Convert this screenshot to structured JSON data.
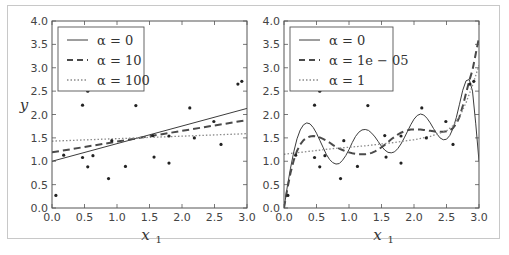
{
  "chart_data": [
    {
      "type": "line",
      "title": "",
      "xlabel": "x_1",
      "ylabel": "y",
      "xlim": [
        0,
        3
      ],
      "ylim": [
        0,
        4
      ],
      "xticks": [
        "0.0",
        "0.5",
        "1.0",
        "1.5",
        "2.0",
        "2.5",
        "3.0"
      ],
      "yticks": [
        "0.0",
        "0.5",
        "1.0",
        "1.5",
        "2.0",
        "2.5",
        "3.0",
        "3.5",
        "4.0"
      ],
      "grid": false,
      "legend_position": "upper left",
      "scatter": {
        "x": [
          0.06,
          0.18,
          0.47,
          0.47,
          0.55,
          0.55,
          0.63,
          0.87,
          0.92,
          1.13,
          1.29,
          1.55,
          1.57,
          1.8,
          1.8,
          2.12,
          2.19,
          2.49,
          2.6,
          2.86,
          2.92
        ],
        "y": [
          0.27,
          1.13,
          2.2,
          1.08,
          2.5,
          0.88,
          1.12,
          0.63,
          1.44,
          0.89,
          2.19,
          1.55,
          1.09,
          0.96,
          1.54,
          2.14,
          1.5,
          1.85,
          1.36,
          2.65,
          2.71
        ]
      },
      "series": [
        {
          "name": "α = 0",
          "style": "solid",
          "x": [
            0,
            3
          ],
          "y": [
            1.0,
            2.13
          ]
        },
        {
          "name": "α = 10",
          "style": "dashed",
          "x": [
            0,
            3
          ],
          "y": [
            1.19,
            1.88
          ]
        },
        {
          "name": "α = 100",
          "style": "dotted",
          "x": [
            0,
            3
          ],
          "y": [
            1.43,
            1.59
          ]
        }
      ]
    },
    {
      "type": "line",
      "title": "",
      "xlabel": "x_1",
      "ylabel": "",
      "xlim": [
        0,
        3
      ],
      "ylim": [
        0,
        4
      ],
      "xticks": [
        "0.0",
        "0.5",
        "1.0",
        "1.5",
        "2.0",
        "2.5",
        "3.0"
      ],
      "yticks": [
        "0.0",
        "0.5",
        "1.0",
        "1.5",
        "2.0",
        "2.5",
        "3.0",
        "3.5",
        "4.0"
      ],
      "grid": false,
      "legend_position": "upper left",
      "scatter": {
        "x": [
          0.06,
          0.18,
          0.47,
          0.47,
          0.55,
          0.55,
          0.63,
          0.87,
          0.92,
          1.13,
          1.29,
          1.55,
          1.57,
          1.8,
          1.8,
          2.12,
          2.19,
          2.49,
          2.6,
          2.86,
          2.92
        ],
        "y": [
          0.27,
          1.13,
          2.2,
          1.08,
          2.5,
          0.88,
          1.12,
          0.63,
          1.44,
          0.89,
          2.19,
          1.55,
          1.09,
          0.96,
          1.54,
          2.14,
          1.5,
          1.85,
          1.36,
          2.65,
          2.71
        ]
      },
      "series": [
        {
          "name": "α = 0",
          "style": "solid",
          "x": [
            0.0,
            0.05,
            0.1,
            0.15,
            0.2,
            0.25,
            0.3,
            0.35,
            0.4,
            0.45,
            0.5,
            0.55,
            0.6,
            0.65,
            0.7,
            0.75,
            0.8,
            0.85,
            0.9,
            0.95,
            1.0,
            1.05,
            1.1,
            1.15,
            1.2,
            1.25,
            1.3,
            1.35,
            1.4,
            1.45,
            1.5,
            1.55,
            1.6,
            1.65,
            1.7,
            1.75,
            1.8,
            1.85,
            1.9,
            1.95,
            2.0,
            2.05,
            2.1,
            2.15,
            2.2,
            2.25,
            2.3,
            2.35,
            2.4,
            2.45,
            2.5,
            2.55,
            2.6,
            2.65,
            2.7,
            2.75,
            2.8,
            2.85,
            2.9,
            2.95,
            3.0
          ],
          "y": [
            0.0,
            0.45,
            0.85,
            1.2,
            1.48,
            1.67,
            1.78,
            1.82,
            1.8,
            1.72,
            1.6,
            1.45,
            1.3,
            1.15,
            1.04,
            0.97,
            0.94,
            0.95,
            1.02,
            1.12,
            1.25,
            1.4,
            1.53,
            1.62,
            1.67,
            1.68,
            1.66,
            1.6,
            1.52,
            1.42,
            1.32,
            1.24,
            1.19,
            1.18,
            1.2,
            1.27,
            1.37,
            1.5,
            1.64,
            1.78,
            1.9,
            1.98,
            2.01,
            1.99,
            1.92,
            1.82,
            1.7,
            1.59,
            1.5,
            1.46,
            1.47,
            1.55,
            1.7,
            1.93,
            2.22,
            2.52,
            2.72,
            2.75,
            2.5,
            1.8,
            1.0
          ]
        },
        {
          "name": "α = 1e − 05",
          "style": "dashed",
          "x": [
            0.0,
            0.05,
            0.1,
            0.15,
            0.2,
            0.25,
            0.3,
            0.35,
            0.4,
            0.45,
            0.5,
            0.55,
            0.6,
            0.65,
            0.7,
            0.75,
            0.8,
            0.85,
            0.9,
            0.95,
            1.0,
            1.05,
            1.1,
            1.15,
            1.2,
            1.25,
            1.3,
            1.35,
            1.4,
            1.45,
            1.5,
            1.55,
            1.6,
            1.65,
            1.7,
            1.75,
            1.8,
            1.85,
            1.9,
            1.95,
            2.0,
            2.05,
            2.1,
            2.15,
            2.2,
            2.25,
            2.3,
            2.35,
            2.4,
            2.45,
            2.5,
            2.55,
            2.6,
            2.65,
            2.7,
            2.75,
            2.8,
            2.85,
            2.9,
            2.95,
            3.0
          ],
          "y": [
            0.0,
            0.4,
            0.75,
            1.02,
            1.22,
            1.36,
            1.45,
            1.5,
            1.53,
            1.54,
            1.53,
            1.51,
            1.48,
            1.44,
            1.4,
            1.35,
            1.31,
            1.27,
            1.24,
            1.21,
            1.19,
            1.17,
            1.16,
            1.15,
            1.15,
            1.15,
            1.16,
            1.18,
            1.21,
            1.25,
            1.3,
            1.35,
            1.41,
            1.47,
            1.52,
            1.57,
            1.61,
            1.64,
            1.66,
            1.68,
            1.68,
            1.68,
            1.68,
            1.67,
            1.66,
            1.65,
            1.64,
            1.63,
            1.63,
            1.63,
            1.64,
            1.66,
            1.71,
            1.8,
            1.95,
            2.18,
            2.45,
            2.72,
            2.95,
            3.3,
            3.65
          ]
        },
        {
          "name": "α = 1",
          "style": "dotted",
          "x": [
            0.0,
            0.25,
            0.5,
            0.75,
            1.0,
            1.25,
            1.5,
            1.75,
            2.0,
            2.25,
            2.5,
            2.6,
            2.7,
            2.8,
            2.9,
            3.0
          ],
          "y": [
            1.15,
            1.19,
            1.23,
            1.27,
            1.3,
            1.33,
            1.37,
            1.41,
            1.46,
            1.53,
            1.65,
            1.76,
            1.95,
            2.25,
            2.62,
            3.05
          ]
        }
      ]
    }
  ],
  "panels": [
    {
      "ylabel": "y",
      "ylabel_sub": "",
      "xlabel": "x",
      "xlabel_sub": "1",
      "legend": [
        "α = 0",
        "α = 10",
        "α = 100"
      ]
    },
    {
      "ylabel": "",
      "ylabel_sub": "",
      "xlabel": "x",
      "xlabel_sub": "1",
      "legend": [
        "α = 0",
        "α = 1e − 05",
        "α = 1"
      ]
    }
  ],
  "colors": {
    "frame_border": "#c8c8c8",
    "axes": "#555555",
    "line": "#3c3c3c",
    "dashed": "#4a4a4a",
    "dotted": "#8a8a8a",
    "points": "#222222"
  }
}
